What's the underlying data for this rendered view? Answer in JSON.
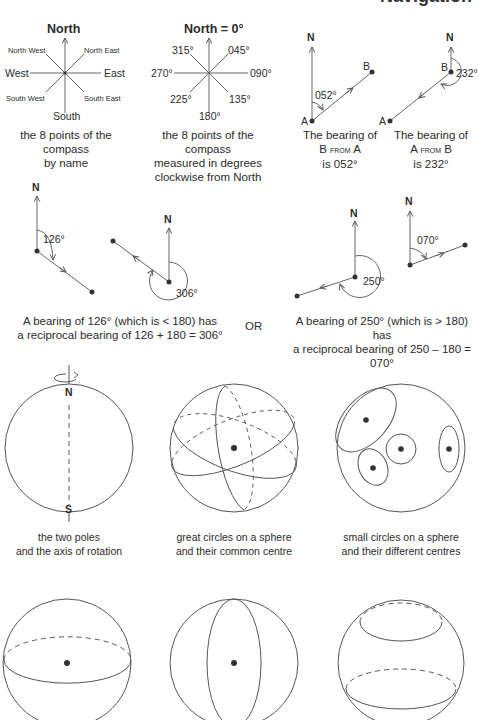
{
  "page": {
    "heading": "Navigation"
  },
  "compass_names": {
    "north": "North",
    "south": "South",
    "east": "East",
    "west": "West",
    "north_east": "North East",
    "north_west": "North West",
    "south_east": "South East",
    "south_west": "South West",
    "caption_line1": "the 8 points of the compass",
    "caption_line2": "by name"
  },
  "compass_degrees": {
    "north": "North = 0°",
    "d045": "045°",
    "d090": "090°",
    "d135": "135°",
    "d180": "180°",
    "d225": "225°",
    "d270": "270°",
    "d315": "315°",
    "caption_line1": "the 8 points of the compass",
    "caption_line2": "measured in degrees",
    "caption_line3": "clockwise from North"
  },
  "bearing_b_from_a": {
    "north": "N",
    "point_a": "A",
    "point_b": "B",
    "angle": "052°",
    "caption_line1": "The bearing of",
    "caption_line2_pre": "B ",
    "caption_line2_sc": "from",
    "caption_line2_post": " A",
    "caption_line3": "is 052°"
  },
  "bearing_a_from_b": {
    "north": "N",
    "point_a": "A",
    "point_b": "B",
    "angle": "232°",
    "caption_line1": "The bearing of",
    "caption_line2_pre": "A ",
    "caption_line2_sc": "from",
    "caption_line2_post": " B",
    "caption_line3": "is 232°"
  },
  "reciprocal_less": {
    "north": "N",
    "angle1": "126°",
    "angle2": "306°",
    "caption_line1": "A bearing of 126° (which is < 180) has",
    "caption_line2": "a reciprocal bearing of 126 + 180 = 306°"
  },
  "or_label": "OR",
  "reciprocal_greater": {
    "north": "N",
    "angle1": "250°",
    "angle2": "070°",
    "caption_line1": "A bearing of 250° (which is > 180) has",
    "caption_line2": "a reciprocal bearing of 250 – 180 = 070°"
  },
  "sphere_poles": {
    "north": "N",
    "south": "S",
    "caption_line1": "the two poles",
    "caption_line2": "and the axis of rotation"
  },
  "sphere_great_circles": {
    "caption_line1": "great circles on a sphere",
    "caption_line2": "and their common centre"
  },
  "sphere_small_circles": {
    "caption_line1": "small circles on a sphere",
    "caption_line2": "and their different centres"
  },
  "colors": {
    "line": "#555555",
    "dot": "#333333",
    "text": "#2b2b2b"
  }
}
